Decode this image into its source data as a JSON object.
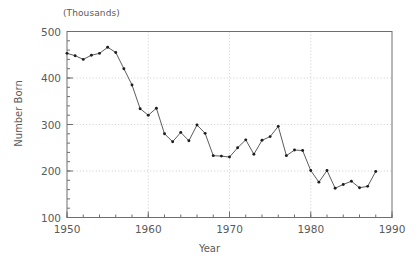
{
  "chart_data": {
    "type": "line",
    "title": "",
    "subtitle": "",
    "unit_note": "(Thousands)",
    "xlabel": "Year",
    "ylabel": "Number Born",
    "xlim": [
      1950,
      1990
    ],
    "ylim": [
      100,
      500
    ],
    "xticks": [
      1950,
      1960,
      1970,
      1980,
      1990
    ],
    "yticks": [
      100,
      200,
      300,
      400,
      500
    ],
    "xticklabels": [
      "1950",
      "1960",
      "1970",
      "1980",
      "1990"
    ],
    "yticklabels": [
      "100",
      "200",
      "300",
      "400",
      "500"
    ],
    "x_minor_tick_interval": 2,
    "y_minor_tick_interval": 20,
    "grid": true,
    "grid_axis": "both",
    "grid_style": "dotted",
    "legend": null,
    "legend_position": "none",
    "marker": "dot",
    "line_color": "#4a4a4a",
    "marker_color": "#1d1d1d",
    "x": [
      1950,
      1951,
      1952,
      1953,
      1954,
      1955,
      1956,
      1957,
      1958,
      1959,
      1960,
      1961,
      1962,
      1963,
      1964,
      1965,
      1966,
      1967,
      1968,
      1969,
      1970,
      1971,
      1972,
      1973,
      1974,
      1975,
      1976,
      1977,
      1978,
      1979,
      1980,
      1981,
      1982,
      1983,
      1984,
      1985,
      1986,
      1987,
      1988
    ],
    "values": [
      453,
      448,
      440,
      449,
      453,
      466,
      455,
      420,
      385,
      334,
      320,
      335,
      280,
      263,
      283,
      265,
      299,
      281,
      233,
      232,
      230,
      250,
      267,
      236,
      266,
      274,
      296,
      233,
      245,
      244,
      201,
      176,
      201,
      163,
      171,
      178,
      164,
      167,
      199
    ],
    "series": [
      {
        "name": "Number Born",
        "values": [
          453,
          448,
          440,
          449,
          453,
          466,
          455,
          420,
          385,
          334,
          320,
          335,
          280,
          263,
          283,
          265,
          299,
          281,
          233,
          232,
          230,
          250,
          267,
          236,
          266,
          274,
          296,
          233,
          245,
          244,
          201,
          176,
          201,
          163,
          171,
          178,
          164,
          167,
          199
        ]
      }
    ]
  },
  "colors": {
    "background": "#ffffff",
    "axis": "#6e6e6e",
    "grid": "#b9b9b9",
    "text": "#5a5a5a",
    "line": "#4a4a4a",
    "marker": "#1d1d1d"
  }
}
